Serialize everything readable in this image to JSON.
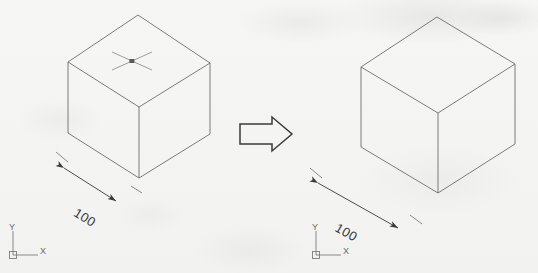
{
  "drawing": {
    "title": "Isometric cube transformation",
    "background_color": "#f4f4f2",
    "line_color": "#6e6e6e",
    "text_color": "#353535",
    "note": "scanned CAD exercise sheet"
  },
  "left_view": {
    "name": "source-cube",
    "cube": {
      "label": "isometric-cube",
      "edge_dimension": "100",
      "top_face_marker": "cross-grip-marker"
    },
    "dimension": {
      "value": "100",
      "arrowheads": "both-ends",
      "placement": "lower-left-edge"
    },
    "ucs": {
      "x_label": "X",
      "y_label": "Y",
      "origin_marker": "square"
    }
  },
  "transform_arrow": {
    "name": "transform-arrow",
    "direction": "right",
    "style": "hollow-block-arrow"
  },
  "right_view": {
    "name": "result-cube",
    "cube": {
      "label": "isometric-cube",
      "edge_dimension": "100",
      "top_face_marker": ""
    },
    "dimension": {
      "value": "100",
      "arrowheads": "both-ends",
      "placement": "lower-left-edge"
    },
    "ucs": {
      "x_label": "X",
      "y_label": "Y",
      "origin_marker": "square"
    }
  }
}
